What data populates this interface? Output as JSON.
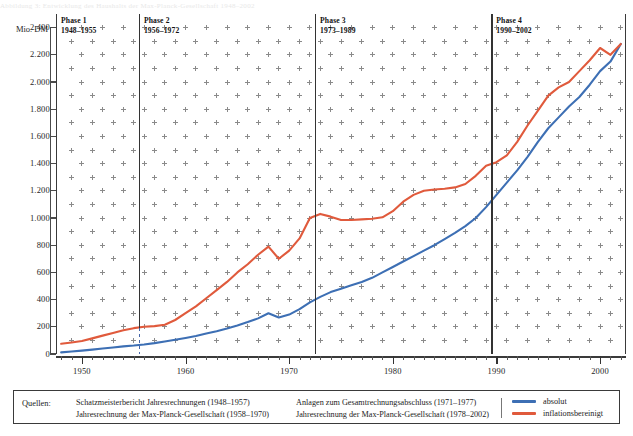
{
  "title_strip": "Abbildung 3:  Entwicklung des Haushalts der Max-Planck-Gesellschaft 1948–2002",
  "axis": {
    "y_unit": "Mio. DM",
    "y_ticks": [
      "2.400",
      "2.200",
      "2.000",
      "1.800",
      "1.600",
      "1.400",
      "1.200",
      "1.000",
      "800",
      "600",
      "400",
      "200",
      "0"
    ],
    "y_values": [
      2400,
      2200,
      2000,
      1800,
      1600,
      1400,
      1200,
      1000,
      800,
      600,
      400,
      200,
      0
    ],
    "x_labels": [
      "1950",
      "1960",
      "1970",
      "1980",
      "1990",
      "2000"
    ],
    "x_values": [
      1950,
      1960,
      1970,
      1980,
      1990,
      2000
    ]
  },
  "phases": [
    {
      "name": "Phase 1",
      "years": "1948–1955",
      "start": 1948,
      "end": 1955
    },
    {
      "name": "Phase 2",
      "years": "1956–1972",
      "start": 1956,
      "end": 1972
    },
    {
      "name": "Phase 3",
      "years": "1973–1989",
      "start": 1973,
      "end": 1989
    },
    {
      "name": "Phase 4",
      "years": "1990–2002",
      "start": 1990,
      "end": 2002
    }
  ],
  "sources": {
    "label": "Quellen:",
    "col1": [
      "Schatzmeisterbericht Jahresrechnungen (1948–1957)",
      "Jahresrechnung der Max-Planck-Gesellschaft (1958–1970)"
    ],
    "col2": [
      "Anlagen zum Gesamtrechnungsabschluss (1971–1977)",
      "Jahresrechnung der Max-Planck-Gesellschaft (1978–2002)"
    ]
  },
  "legend": [
    {
      "label": "absolut",
      "color": "#3d6fb4"
    },
    {
      "label": "inflationsbereinigt",
      "color": "#e05a3c"
    }
  ],
  "colors": {
    "absolut": "#3d6fb4",
    "inflationsbereinigt": "#e05a3c",
    "axis": "#3a3a3a",
    "grid": "#8a8a8a",
    "phase_divider": "#333333"
  },
  "chart_data": {
    "type": "line",
    "title": "Entwicklung des Haushalts der Max-Planck-Gesellschaft 1948–2002",
    "xlabel": "",
    "ylabel": "Mio. DM",
    "xlim": [
      1947.5,
      2002.5
    ],
    "ylim": [
      0,
      2500
    ],
    "grid": true,
    "legend_position": "bottom-right",
    "x": [
      1948,
      1949,
      1950,
      1951,
      1952,
      1953,
      1954,
      1955,
      1956,
      1957,
      1958,
      1959,
      1960,
      1961,
      1962,
      1963,
      1964,
      1965,
      1966,
      1967,
      1968,
      1969,
      1970,
      1971,
      1972,
      1973,
      1974,
      1975,
      1976,
      1977,
      1978,
      1979,
      1980,
      1981,
      1982,
      1983,
      1984,
      1985,
      1986,
      1987,
      1988,
      1989,
      1990,
      1991,
      1992,
      1993,
      1994,
      1995,
      1996,
      1997,
      1998,
      1999,
      2000,
      2001,
      2002
    ],
    "series": [
      {
        "name": "absolut",
        "color": "#3d6fb4",
        "values": [
          12,
          18,
          25,
          32,
          40,
          48,
          56,
          62,
          70,
          80,
          92,
          105,
          118,
          132,
          150,
          168,
          188,
          210,
          235,
          262,
          300,
          268,
          290,
          330,
          380,
          420,
          455,
          480,
          505,
          530,
          560,
          600,
          640,
          680,
          720,
          760,
          800,
          845,
          890,
          940,
          1000,
          1080,
          1170,
          1260,
          1350,
          1450,
          1560,
          1660,
          1740,
          1820,
          1890,
          1980,
          2080,
          2150,
          2280
        ]
      },
      {
        "name": "inflationsbereinigt",
        "color": "#e05a3c",
        "values": [
          75,
          85,
          95,
          115,
          135,
          155,
          175,
          190,
          200,
          205,
          215,
          250,
          300,
          350,
          410,
          470,
          530,
          600,
          660,
          730,
          790,
          700,
          760,
          850,
          1000,
          1030,
          1010,
          985,
          985,
          990,
          995,
          1005,
          1050,
          1120,
          1170,
          1200,
          1210,
          1215,
          1225,
          1250,
          1310,
          1385,
          1410,
          1460,
          1560,
          1680,
          1790,
          1900,
          1960,
          2000,
          2080,
          2160,
          2250,
          2200,
          2280
        ]
      }
    ]
  }
}
